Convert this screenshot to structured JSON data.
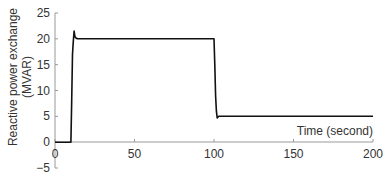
{
  "chart_data": {
    "type": "line",
    "title": "",
    "xlabel": "Time (second)",
    "ylabel": "Reactive power exchange (MVAR)",
    "ylabel_lines": [
      "Reactive power exchange",
      "(MVAR)"
    ],
    "xlim": [
      0,
      200
    ],
    "ylim": [
      -5,
      25
    ],
    "xticks": [
      0,
      50,
      100,
      150,
      200
    ],
    "yticks": [
      -5,
      0,
      5,
      10,
      15,
      20,
      25
    ],
    "grid": false,
    "legend": null,
    "series": [
      {
        "name": "Reactive power exchange",
        "color": "#111111",
        "x": [
          0,
          10,
          10.5,
          11,
          11.5,
          12,
          12.5,
          13,
          14,
          100,
          100.5,
          101,
          101.5,
          102,
          103,
          105,
          200
        ],
        "y": [
          0,
          0,
          8,
          17,
          19.5,
          21.5,
          20.5,
          20.2,
          20,
          20,
          15,
          9,
          6,
          4.7,
          5,
          5,
          5
        ]
      }
    ]
  }
}
